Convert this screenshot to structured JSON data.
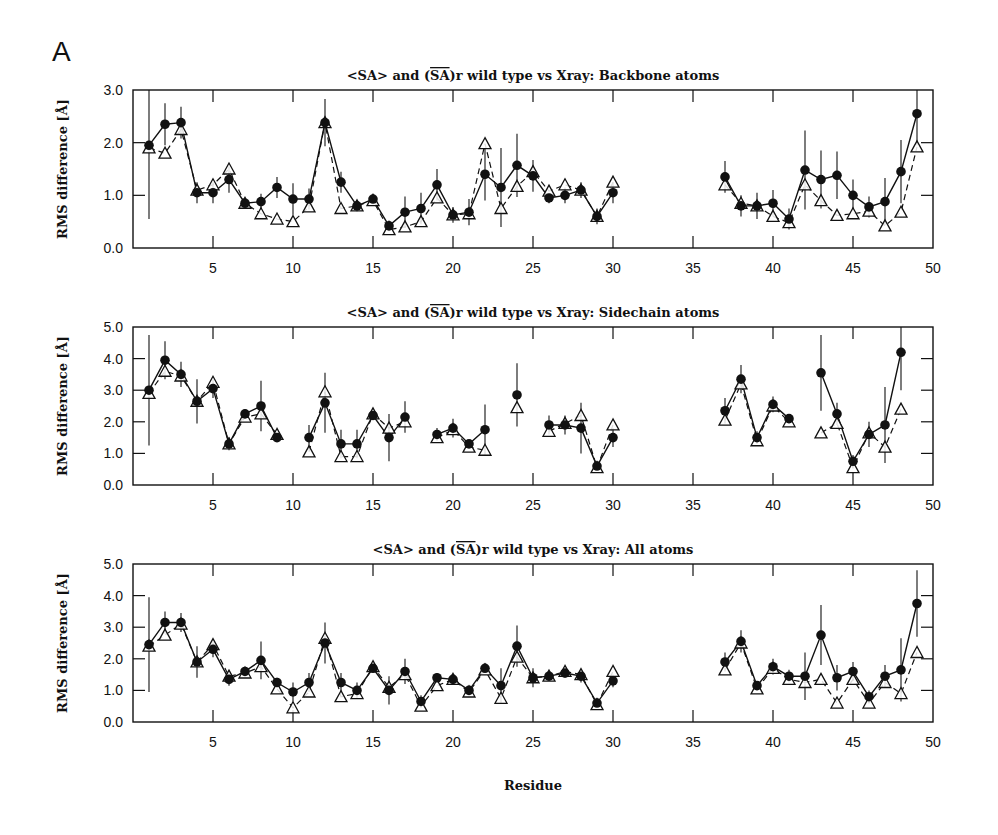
{
  "figure": {
    "panel_label": "A",
    "xlabel": "Residue"
  },
  "legend_markers": {
    "filled_circle": "<SA> (mean, with error bars, solid line)",
    "open_triangle": "(SA)r (dashed line)"
  },
  "chart_data": [
    {
      "type": "line",
      "title": "<SA> and (SA)r wild type vs Xray: Backbone atoms",
      "xlabel": "",
      "ylabel": "RMS difference [Å]",
      "xlim": [
        0,
        50
      ],
      "ylim": [
        0,
        3.0
      ],
      "xticks": [
        5,
        10,
        15,
        20,
        25,
        30,
        35,
        40,
        45,
        50
      ],
      "yticks": [
        "0.0",
        "1.0",
        "2.0",
        "3.0"
      ],
      "grid": false,
      "x": [
        1,
        2,
        3,
        4,
        5,
        6,
        7,
        8,
        9,
        10,
        11,
        12,
        13,
        14,
        15,
        16,
        17,
        18,
        19,
        20,
        21,
        22,
        23,
        24,
        25,
        26,
        27,
        28,
        29,
        30,
        31,
        32,
        33,
        34,
        35,
        36,
        37,
        38,
        39,
        40,
        41,
        42,
        43,
        44,
        45,
        46,
        47,
        48,
        49
      ],
      "series": [
        {
          "name": "<SA>",
          "marker": "filled-circle",
          "line": "solid",
          "values": [
            1.95,
            2.35,
            2.38,
            1.05,
            1.05,
            1.3,
            0.85,
            0.88,
            1.15,
            0.93,
            0.93,
            2.38,
            1.25,
            0.8,
            0.93,
            0.42,
            0.68,
            0.75,
            1.2,
            0.63,
            0.68,
            1.4,
            1.15,
            1.57,
            1.37,
            0.95,
            1.0,
            1.1,
            0.6,
            1.05,
            null,
            null,
            null,
            null,
            null,
            null,
            1.35,
            0.8,
            0.8,
            0.85,
            0.55,
            1.48,
            1.3,
            1.38,
            1.0,
            0.78,
            0.88,
            1.45,
            2.55
          ],
          "err": [
            1.4,
            0.4,
            0.3,
            0.2,
            0.2,
            0.25,
            0.1,
            0.15,
            0.2,
            0.3,
            0.2,
            0.45,
            0.2,
            0.1,
            0.1,
            0.1,
            0.3,
            0.3,
            0.3,
            0.15,
            0.25,
            0.5,
            0.75,
            0.6,
            0.3,
            0.1,
            0.15,
            0.15,
            0.15,
            0.2,
            null,
            null,
            null,
            null,
            null,
            null,
            0.3,
            0.2,
            0.25,
            0.25,
            0.2,
            0.75,
            0.55,
            0.45,
            0.3,
            0.2,
            0.45,
            0.6,
            0.6
          ]
        },
        {
          "name": "(SA)r",
          "marker": "open-triangle",
          "line": "dashed",
          "values": [
            1.9,
            1.8,
            2.25,
            1.1,
            1.2,
            1.5,
            0.85,
            0.65,
            0.55,
            0.5,
            0.78,
            2.38,
            0.75,
            0.8,
            0.9,
            0.35,
            0.4,
            0.5,
            0.95,
            0.63,
            0.65,
            1.98,
            0.75,
            1.17,
            1.45,
            1.08,
            1.2,
            1.1,
            0.6,
            1.25,
            null,
            null,
            null,
            null,
            null,
            null,
            1.2,
            0.85,
            0.8,
            0.6,
            0.48,
            1.2,
            0.9,
            0.62,
            0.65,
            0.7,
            0.42,
            0.68,
            1.92
          ]
        }
      ]
    },
    {
      "type": "line",
      "title": "<SA> and (SA)r wild type vs Xray: Sidechain atoms",
      "xlabel": "",
      "ylabel": "RMS difference [Å]",
      "xlim": [
        0,
        50
      ],
      "ylim": [
        0,
        5.0
      ],
      "xticks": [
        5,
        10,
        15,
        20,
        25,
        30,
        35,
        40,
        45,
        50
      ],
      "yticks": [
        "0.0",
        "1.0",
        "2.0",
        "3.0",
        "4.0",
        "5.0"
      ],
      "grid": false,
      "x": [
        1,
        2,
        3,
        4,
        5,
        6,
        7,
        8,
        9,
        10,
        11,
        12,
        13,
        14,
        15,
        16,
        17,
        18,
        19,
        20,
        21,
        22,
        23,
        24,
        25,
        26,
        27,
        28,
        29,
        30,
        31,
        32,
        33,
        34,
        35,
        36,
        37,
        38,
        39,
        40,
        41,
        42,
        43,
        44,
        45,
        46,
        47,
        48,
        49
      ],
      "series": [
        {
          "name": "<SA>",
          "marker": "filled-circle",
          "line": "solid",
          "values": [
            3.0,
            3.95,
            3.5,
            2.65,
            3.05,
            1.3,
            2.25,
            2.5,
            1.5,
            null,
            1.5,
            2.6,
            1.3,
            1.3,
            2.2,
            1.5,
            2.15,
            null,
            1.6,
            1.8,
            1.3,
            1.75,
            null,
            2.85,
            null,
            1.9,
            1.9,
            1.8,
            0.6,
            1.5,
            null,
            null,
            null,
            null,
            null,
            null,
            2.35,
            3.35,
            1.5,
            2.55,
            2.1,
            null,
            3.55,
            2.25,
            0.75,
            1.6,
            1.9,
            4.2,
            null
          ],
          "err": [
            1.75,
            0.6,
            0.4,
            0.7,
            0.3,
            0.2,
            0.15,
            0.8,
            0.1,
            null,
            0.4,
            0.95,
            0.45,
            0.45,
            0.1,
            0.75,
            0.5,
            null,
            0.2,
            0.3,
            0.1,
            0.8,
            null,
            1.0,
            null,
            0.3,
            0.3,
            0.8,
            0.1,
            0.3,
            null,
            null,
            null,
            null,
            null,
            null,
            0.4,
            0.45,
            0.2,
            0.25,
            0.15,
            null,
            1.2,
            0.35,
            0.2,
            0.4,
            1.2,
            1.2,
            null
          ]
        },
        {
          "name": "(SA)r",
          "marker": "open-triangle",
          "line": "dashed",
          "values": [
            2.9,
            3.6,
            3.45,
            2.65,
            3.25,
            1.3,
            2.15,
            2.25,
            1.6,
            null,
            1.05,
            2.95,
            0.9,
            0.9,
            2.25,
            1.8,
            2.0,
            null,
            1.5,
            1.75,
            1.2,
            1.1,
            null,
            2.45,
            null,
            1.7,
            1.95,
            2.2,
            0.55,
            1.9,
            null,
            null,
            null,
            null,
            null,
            null,
            2.05,
            3.2,
            1.4,
            2.5,
            2.0,
            null,
            1.65,
            1.95,
            0.55,
            1.65,
            1.2,
            2.4,
            null
          ]
        }
      ]
    },
    {
      "type": "line",
      "title": "<SA> and (SA)r wild type vs Xray: All atoms",
      "xlabel": "Residue",
      "ylabel": "RMS difference [Å]",
      "xlim": [
        0,
        50
      ],
      "ylim": [
        0,
        5.0
      ],
      "xticks": [
        5,
        10,
        15,
        20,
        25,
        30,
        35,
        40,
        45,
        50
      ],
      "yticks": [
        "0.0",
        "1.0",
        "2.0",
        "3.0",
        "4.0",
        "5.0"
      ],
      "grid": false,
      "x": [
        1,
        2,
        3,
        4,
        5,
        6,
        7,
        8,
        9,
        10,
        11,
        12,
        13,
        14,
        15,
        16,
        17,
        18,
        19,
        20,
        21,
        22,
        23,
        24,
        25,
        26,
        27,
        28,
        29,
        30,
        31,
        32,
        33,
        34,
        35,
        36,
        37,
        38,
        39,
        40,
        41,
        42,
        43,
        44,
        45,
        46,
        47,
        48,
        49
      ],
      "series": [
        {
          "name": "<SA>",
          "marker": "filled-circle",
          "line": "solid",
          "values": [
            2.45,
            3.15,
            3.15,
            1.9,
            2.3,
            1.35,
            1.6,
            1.95,
            1.25,
            0.95,
            1.25,
            2.5,
            1.25,
            1.0,
            1.7,
            1.0,
            1.6,
            0.65,
            1.4,
            1.35,
            1.0,
            1.7,
            1.15,
            2.4,
            1.4,
            1.45,
            1.55,
            1.45,
            0.6,
            1.3,
            null,
            null,
            null,
            null,
            null,
            null,
            1.9,
            2.55,
            1.15,
            1.75,
            1.45,
            1.45,
            2.75,
            1.4,
            1.6,
            0.8,
            1.45,
            1.65,
            3.75
          ],
          "err": [
            1.5,
            0.35,
            0.3,
            0.5,
            0.25,
            0.2,
            0.1,
            0.6,
            0.15,
            0.3,
            0.3,
            0.65,
            0.3,
            0.25,
            0.1,
            0.45,
            0.4,
            0.2,
            0.15,
            0.15,
            0.1,
            0.15,
            0.55,
            0.65,
            0.3,
            0.15,
            0.15,
            0.2,
            0.1,
            0.2,
            null,
            null,
            null,
            null,
            null,
            null,
            0.3,
            0.35,
            0.15,
            0.25,
            0.2,
            0.75,
            0.95,
            0.4,
            0.3,
            0.2,
            0.35,
            1.0,
            1.05
          ]
        },
        {
          "name": "(SA)r",
          "marker": "open-triangle",
          "line": "dashed",
          "values": [
            2.4,
            2.75,
            3.1,
            1.9,
            2.45,
            1.45,
            1.55,
            1.75,
            1.05,
            0.45,
            0.95,
            2.65,
            0.8,
            0.9,
            1.75,
            1.1,
            1.5,
            0.5,
            1.15,
            1.35,
            0.95,
            1.65,
            0.75,
            2.05,
            1.4,
            1.45,
            1.6,
            1.5,
            0.55,
            1.6,
            null,
            null,
            null,
            null,
            null,
            null,
            1.65,
            2.5,
            1.05,
            1.7,
            1.35,
            1.25,
            1.35,
            0.6,
            1.35,
            0.6,
            1.25,
            0.9,
            2.2
          ]
        }
      ]
    }
  ]
}
